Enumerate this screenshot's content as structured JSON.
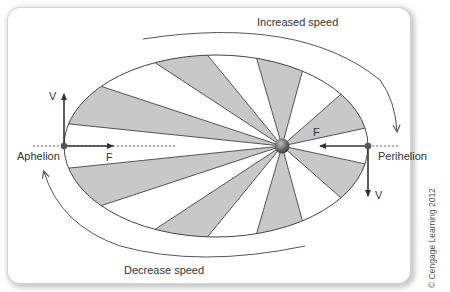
{
  "diagram": {
    "labels": {
      "increased_speed": "Increased speed",
      "decrease_speed": "Decrease speed",
      "aphelion": "Aphelion",
      "perihelion": "Perihelion",
      "aphelion_velocity": "V",
      "aphelion_force": "F",
      "perihelion_velocity": "V",
      "perihelion_force": "F"
    },
    "copyright": "© Cengage Learning 2012",
    "colors": {
      "sector_fill": "#c8c8c8",
      "line": "#444444",
      "arrow": "#333333",
      "sun": "#6e6e6e",
      "background": "#ffffff"
    },
    "orbit": {
      "cx": 216,
      "cy": 146,
      "rx": 152,
      "ry": 91
    },
    "sun": {
      "x": 282,
      "y": 146,
      "r": 7
    },
    "shaded_sectors": [
      [
        [
          69,
          121
        ],
        [
          95,
          90
        ]
      ],
      [
        [
          151,
          64
        ],
        [
          200,
          55
        ]
      ],
      [
        [
          256,
          59
        ],
        [
          302,
          71
        ]
      ],
      [
        [
          341,
          96
        ],
        [
          364,
          127
        ]
      ],
      [
        [
          364,
          165
        ],
        [
          341,
          196
        ]
      ],
      [
        [
          302,
          220
        ],
        [
          256,
          234
        ]
      ],
      [
        [
          202,
          237
        ],
        [
          151,
          228
        ]
      ],
      [
        [
          97,
          202
        ],
        [
          70,
          171
        ]
      ]
    ]
  }
}
